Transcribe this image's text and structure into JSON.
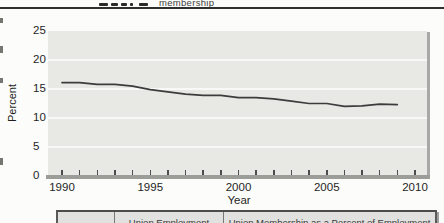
{
  "page": {
    "heading_fragment": "membership"
  },
  "chart": {
    "ylabel": "Percent",
    "xlabel": "Year"
  },
  "chart_data": {
    "type": "line",
    "title": "",
    "xlabel": "Year",
    "ylabel": "Percent",
    "x": [
      1990,
      1991,
      1992,
      1993,
      1994,
      1995,
      1996,
      1997,
      1998,
      1999,
      2000,
      2001,
      2002,
      2003,
      2004,
      2005,
      2006,
      2007,
      2008,
      2009
    ],
    "series": [
      {
        "name": "Union membership (percent)",
        "values": [
          16.1,
          16.1,
          15.8,
          15.8,
          15.5,
          14.9,
          14.5,
          14.1,
          13.9,
          13.9,
          13.5,
          13.5,
          13.3,
          12.9,
          12.5,
          12.5,
          12.0,
          12.1,
          12.4,
          12.3
        ]
      }
    ],
    "xlim": [
      1990,
      2010
    ],
    "ylim": [
      0,
      25
    ],
    "xticks_major": [
      1990,
      1995,
      2000,
      2005,
      2010
    ],
    "xticks_minor_every": 1,
    "yticks": [
      0,
      5,
      10,
      15,
      20,
      25
    ],
    "grid": "horizontal",
    "legend": "none",
    "line_color": "#3c3c3c",
    "panel_color": "#e8e8e5"
  },
  "table": {
    "headers": [
      {
        "label": ""
      },
      {
        "label": "Union Employment"
      },
      {
        "label": "Union Membership as a Percent of Employment"
      }
    ]
  }
}
